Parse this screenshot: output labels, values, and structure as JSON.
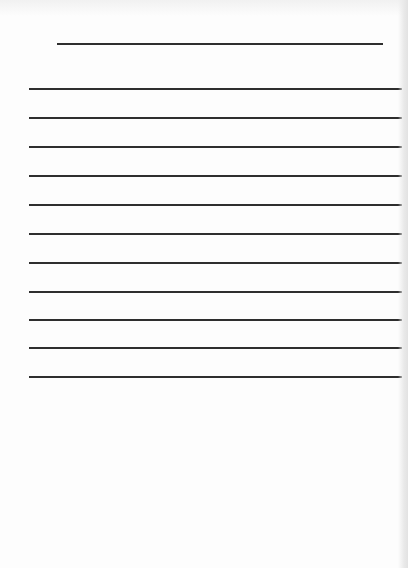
{
  "document": {
    "type": "blank ruled writing sheet",
    "title_line": {
      "text": "",
      "y": 43
    },
    "lines": [
      {
        "text": "",
        "y": 88
      },
      {
        "text": "",
        "y": 117
      },
      {
        "text": "",
        "y": 146
      },
      {
        "text": "",
        "y": 175
      },
      {
        "text": "",
        "y": 204
      },
      {
        "text": "",
        "y": 233
      },
      {
        "text": "",
        "y": 262
      },
      {
        "text": "",
        "y": 291
      },
      {
        "text": "",
        "y": 319
      },
      {
        "text": "",
        "y": 347
      },
      {
        "text": "",
        "y": 376
      }
    ],
    "colors": {
      "paper": "#fdfdfd",
      "rule": "#2e2e2e",
      "edge": "#e2e2e2"
    }
  }
}
